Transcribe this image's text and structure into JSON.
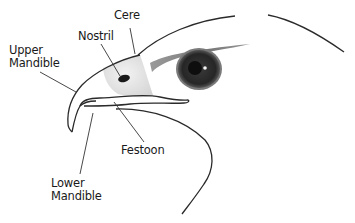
{
  "diagram": {
    "labels": {
      "cere": "Cere",
      "nostril": "Nostril",
      "upper_mandible_line1": "Upper",
      "upper_mandible_line2": "Mandible",
      "festoon": "Festoon",
      "lower_mandible_line1": "Lower",
      "lower_mandible_line2": "Mandible"
    },
    "colors": {
      "outline": "#2a2a2a",
      "cere_fill": "#e6e6e6",
      "eye_ring": "#6a6a6a",
      "eye_iris": "#2b2b2b",
      "pupil": "#0e0e0e",
      "brow": "#8a8a8a",
      "background": "#ffffff"
    }
  }
}
